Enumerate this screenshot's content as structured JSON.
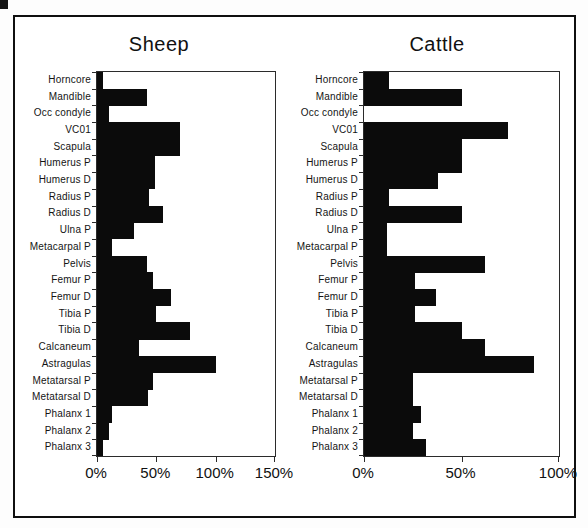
{
  "figure": {
    "background": "#ffffff",
    "border_color": "#0f0f0f",
    "bar_color": "#0b0b0b",
    "axis_color": "#2b2b2b",
    "units": "%"
  },
  "chart_data": [
    {
      "type": "bar",
      "orientation": "horizontal",
      "title": "Sheep",
      "xlabel": "",
      "ylabel": "",
      "xlim": [
        0,
        150
      ],
      "x_tick_labels": [
        "0%",
        "50%",
        "100%",
        "150%"
      ],
      "x_tick_values": [
        0,
        50,
        100,
        150
      ],
      "grid": false,
      "legend": null,
      "categories": [
        "Horncore",
        "Mandible",
        "Occ condyle",
        "VC01",
        "Scapula",
        "Humerus P",
        "Humerus D",
        "Radius P",
        "Radius D",
        "Ulna P",
        "Metacarpal P",
        "Pelvis",
        "Femur P",
        "Femur D",
        "Tibia P",
        "Tibia D",
        "Calcaneum",
        "Astragulas",
        "Metatarsal P",
        "Metatarsal D",
        "Phalanx 1",
        "Phalanx 2",
        "Phalanx 3"
      ],
      "values": [
        5,
        42,
        10,
        70,
        70,
        49,
        49,
        44,
        56,
        31,
        13,
        42,
        47,
        62,
        50,
        78,
        35,
        100,
        47,
        43,
        13,
        10,
        5
      ]
    },
    {
      "type": "bar",
      "orientation": "horizontal",
      "title": "Cattle",
      "xlabel": "",
      "ylabel": "",
      "xlim": [
        0,
        100
      ],
      "x_tick_labels": [
        "0%",
        "50%",
        "100%"
      ],
      "x_tick_values": [
        0,
        50,
        100
      ],
      "grid": false,
      "legend": null,
      "categories": [
        "Horncore",
        "Mandible",
        "Occ condyle",
        "VC01",
        "Scapula",
        "Humerus P",
        "Humerus D",
        "Radius P",
        "Radius D",
        "Ulna P",
        "Metacarpal P",
        "Pelvis",
        "Femur P",
        "Femur D",
        "Tibia P",
        "Tibia D",
        "Calcaneum",
        "Astragulas",
        "Metatarsal P",
        "Metatarsal D",
        "Phalanx 1",
        "Phalanx 2",
        "Phalanx 3"
      ],
      "values": [
        13,
        50,
        0,
        74,
        50,
        50,
        38,
        13,
        50,
        12,
        12,
        62,
        26,
        37,
        26,
        50,
        62,
        87,
        25,
        25,
        29,
        25,
        32
      ]
    }
  ]
}
